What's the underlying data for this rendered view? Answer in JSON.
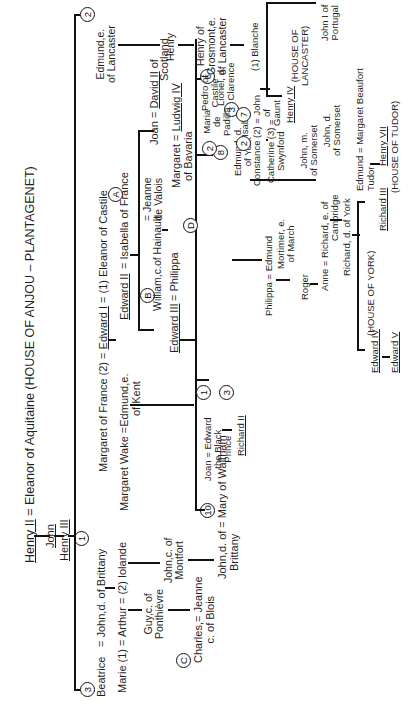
{
  "title": "Henry II = Eleanor of Aquitaine (HOUSE OF ANJOU – PLANTAGENET)",
  "title_parts": {
    "henry2": "Henry II",
    "rest": " = Eleanor of Aquitaine (HOUSE OF ANJOU – PLANTAGENET)"
  },
  "people": {
    "john": "John",
    "henry3": "Henry III",
    "beatrice": "Beatrice",
    "john_d_brittany_eq": "=   John,d. of  Brittany",
    "marie_arthur": "Marie (1) =  Arthur  =  (2) Iolande",
    "guy": [
      "Guy,c. of",
      "Ponthièvre"
    ],
    "john_montfort": [
      "John,c. of",
      "Montfort"
    ],
    "charles_jeanne": [
      "Charles,= Jeanne",
      "c. of Blois"
    ],
    "john_d_of": "John,d. of = Mary of Waltham",
    "brittany": "Brittany",
    "margaret_france": "Margaret of France (2) = ",
    "edward1": "Edward I",
    "eleanor_castile": " = (1) Eleanor of Castile",
    "margaret_wake": "Margaret Wake =Edmund,e.",
    "of_kent": "of Kent",
    "edward2": "Edward II",
    "isabella": "=  Isabella of France",
    "edward3": "Edward III",
    "eq_philippa": "=   Philippa",
    "william_hainault": "William,c.of Hainault",
    "jeanne_valois": [
      "= Jeanne",
      "de Valois"
    ],
    "joan": "Joan  = ",
    "david2": "David II",
    "of_scotland": [
      " of",
      "Scotland"
    ],
    "margaret": "Margaret  = ",
    "ludwig4": "Ludwig IV",
    "of_bavaria": "of Bavaria",
    "edmund_lancaster": [
      "Edmund,e.",
      "of Lancaster"
    ],
    "henry": "Henry",
    "henry_grosmont": [
      "Henry of",
      "Grosmont,e.",
      "of Lancaster"
    ],
    "blanche": "(1) Blanche",
    "john_portugal": [
      "John I of",
      "Portugal"
    ],
    "henry4": "Henry IV",
    "house_lancaster": [
      "(HOUSE OF",
      "LANCASTER)"
    ],
    "joan_edward": [
      "Joan = Edward",
      "the Black",
      "Prince"
    ],
    "richard2": "Richard II",
    "lionel": [
      "Lionel, d.",
      "of Clarence"
    ],
    "edmund_york": [
      "Edmund, d.",
      "of York"
    ],
    "eq_isabel": "= Isabel",
    "pedro": [
      "Pedro of",
      "Castile"
    ],
    "maria_padilla": [
      "Maria",
      "de",
      "Padilla"
    ],
    "constance_john": "Constance (2) = John",
    "of_gaunt": [
      "of",
      "Gaunt"
    ],
    "catherine": [
      "Catherine  (3) =",
      "Swynford"
    ],
    "john_m_somerset": [
      "John, m.",
      "of Somerset"
    ],
    "john_d_somerset": [
      "John, d.",
      "of Somerset"
    ],
    "edmund_margaret": "Edmund  =  Margaret Beaufort",
    "tudor": "Tudor",
    "henry7": "Henry VII",
    "house_tudor": "(HOUSE OF TUDOR)",
    "philippa_edmund": "Philippa  =  Edmund",
    "mortimer": [
      "Mortimer, e.",
      "of March"
    ],
    "roger": "Roger",
    "anne_richard": "Anne = Richard, e. of",
    "cambridge": "Cambridge",
    "richard_york": "Richard, d. of York",
    "house_york": "(HOUSE OF YORK)",
    "edward4": "Edward IV",
    "edward5": "Edward V",
    "richard3": "Richard III"
  },
  "markers": {
    "m1": "1",
    "m2_edmund": "2",
    "m3_beatrice": "3",
    "m10": "10",
    "mA": "A",
    "mB": "B",
    "mC": "C",
    "mD": "D",
    "m1_bp": "1",
    "m3_lionel": "3",
    "m6": "6",
    "m8": "8",
    "m3_isabel": "3",
    "m2_maria": "2",
    "m2_const": "2",
    "m7": "7",
    "m4": "4"
  }
}
